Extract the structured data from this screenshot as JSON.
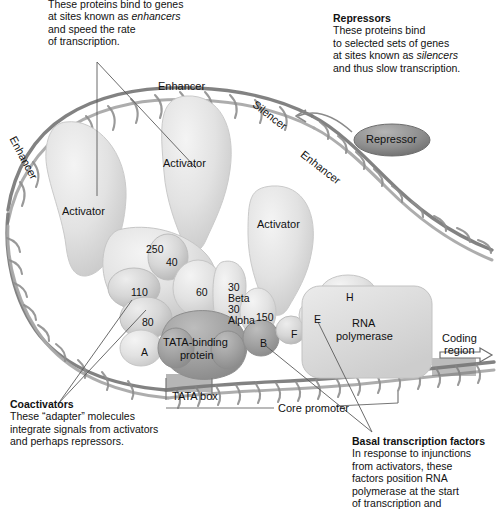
{
  "figure": {
    "kind": "biology-diagram"
  },
  "callouts": {
    "activators": {
      "title": "",
      "lines": [
        "These proteins bind to genes",
        "at sites known as enhancers",
        "and speed the rate",
        "of transcription."
      ],
      "italic_word": "enhancers"
    },
    "repressors": {
      "title": "Repressors",
      "lines": [
        "These proteins bind",
        "to selected sets of genes",
        "at sites known as silencers",
        "and thus slow transcription."
      ],
      "italic_word": "silencers"
    },
    "coactivators": {
      "title": "Coactivators",
      "lines": [
        "These “adapter” molecules",
        "integrate signals from activators",
        "and perhaps repressors."
      ]
    },
    "basal": {
      "title": "Basal transcription factors",
      "lines": [
        "In response to injunctions",
        "from activators, these",
        "factors position RNA",
        "polymerase at the start",
        "of transcription and"
      ]
    }
  },
  "dna_labels": {
    "enhancer_left": "Enhancer",
    "enhancer_top": "Enhancer",
    "enhancer_right": "Enhancer",
    "silencer": "Silencer",
    "tata_box": "TATA box",
    "core_promoter": "Core promoter",
    "coding_region_line1": "Coding",
    "coding_region_line2": "region"
  },
  "proteins": {
    "repressor": "Repressor",
    "activator_left": "Activator",
    "activator_top": "Activator",
    "activator_right": "Activator",
    "tbp_line1": "TATA-binding",
    "tbp_line2": "protein",
    "rna_pol_line1": "RNA",
    "rna_pol_line2": "polymerase"
  },
  "mediator_subunits": [
    {
      "name": "250",
      "x": 146,
      "y": 243
    },
    {
      "name": "40",
      "x": 166,
      "y": 256
    },
    {
      "name": "110",
      "x": 131,
      "y": 286
    },
    {
      "name": "60",
      "x": 196,
      "y": 286
    },
    {
      "name": "80",
      "x": 142,
      "y": 316
    },
    {
      "name": "150",
      "x": 256,
      "y": 311
    },
    {
      "name": "A",
      "x": 141,
      "y": 346
    }
  ],
  "tfii_subunits": [
    {
      "name": "30",
      "x": 228,
      "y": 281
    },
    {
      "name": "Beta",
      "x": 228,
      "y": 292
    },
    {
      "name": "30",
      "x": 228,
      "y": 303
    },
    {
      "name": "Alpha",
      "x": 228,
      "y": 314
    },
    {
      "name": "B",
      "x": 260,
      "y": 337
    },
    {
      "name": "F",
      "x": 291,
      "y": 328
    },
    {
      "name": "E",
      "x": 314,
      "y": 313
    },
    {
      "name": "H",
      "x": 346,
      "y": 291
    }
  ],
  "colors": {
    "background": "#ffffff",
    "text": "#111111",
    "protein_light": "#e3e3e3",
    "protein_mid": "#cfcfcf",
    "protein_dark": "#9a9a9a",
    "repressor_fill": "#8d8d8d",
    "dna_strand": "#8a8a8a",
    "leader_line": "#4a4a4a"
  }
}
